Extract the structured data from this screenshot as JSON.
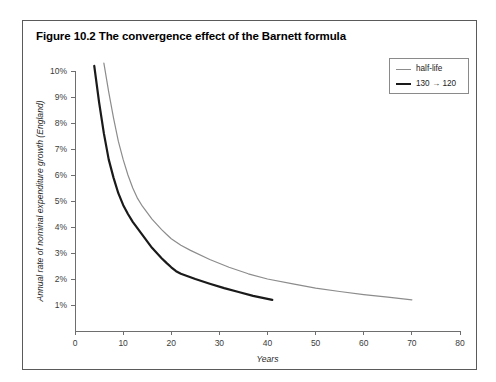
{
  "figure": {
    "title": "Figure 10.2 The convergence effect of the Barnett formula"
  },
  "legend": {
    "entries": [
      {
        "label": "half-life",
        "color": "#8c8c8c",
        "width": 1.2
      },
      {
        "label": "130 → 120",
        "color": "#1a1a1a",
        "width": 2.2
      }
    ]
  },
  "chart_data": {
    "type": "line",
    "title": "Figure 10.2 The convergence effect of the Barnett formula",
    "xlabel": "Years",
    "ylabel": "Annual rate of nominal expenditure growth (England)",
    "xlim": [
      0,
      80
    ],
    "ylim": [
      0,
      10.4
    ],
    "xticks": [
      0,
      10,
      20,
      30,
      40,
      50,
      60,
      70,
      80
    ],
    "xtick_labels": [
      "0",
      "10",
      "20",
      "30",
      "40",
      "50",
      "60",
      "70",
      "80"
    ],
    "yticks": [
      1,
      2,
      3,
      4,
      5,
      6,
      7,
      8,
      9,
      10
    ],
    "ytick_labels": [
      "1%",
      "2%",
      "3%",
      "4%",
      "5%",
      "6%",
      "7%",
      "8%",
      "9%",
      "10%"
    ],
    "grid": false,
    "legend_position": "top-right",
    "series": [
      {
        "name": "half-life",
        "color": "#8c8c8c",
        "stroke_width": 1.2,
        "points": [
          [
            6.0,
            10.3
          ],
          [
            7.0,
            9.2
          ],
          [
            8.0,
            8.2
          ],
          [
            9.0,
            7.3
          ],
          [
            10.0,
            6.6
          ],
          [
            11.0,
            6.0
          ],
          [
            12.0,
            5.5
          ],
          [
            13.0,
            5.1
          ],
          [
            14.0,
            4.8
          ],
          [
            15.0,
            4.55
          ],
          [
            16.0,
            4.3
          ],
          [
            17.0,
            4.1
          ],
          [
            18.0,
            3.9
          ],
          [
            19.0,
            3.72
          ],
          [
            20.0,
            3.55
          ],
          [
            22.0,
            3.3
          ],
          [
            24.0,
            3.1
          ],
          [
            28.0,
            2.75
          ],
          [
            32.0,
            2.45
          ],
          [
            36.0,
            2.2
          ],
          [
            40.0,
            2.0
          ],
          [
            45.0,
            1.82
          ],
          [
            50.0,
            1.65
          ],
          [
            55.0,
            1.52
          ],
          [
            60.0,
            1.4
          ],
          [
            65.0,
            1.3
          ],
          [
            70.0,
            1.2
          ]
        ]
      },
      {
        "name": "130 → 120",
        "color": "#1a1a1a",
        "stroke_width": 2.2,
        "points": [
          [
            4.0,
            10.2
          ],
          [
            5.0,
            8.8
          ],
          [
            6.0,
            7.6
          ],
          [
            7.0,
            6.6
          ],
          [
            8.0,
            5.9
          ],
          [
            9.0,
            5.3
          ],
          [
            10.0,
            4.85
          ],
          [
            11.0,
            4.5
          ],
          [
            12.0,
            4.2
          ],
          [
            13.0,
            3.95
          ],
          [
            14.0,
            3.7
          ],
          [
            15.0,
            3.45
          ],
          [
            16.0,
            3.2
          ],
          [
            17.0,
            3.0
          ],
          [
            18.0,
            2.8
          ],
          [
            19.0,
            2.62
          ],
          [
            20.0,
            2.45
          ],
          [
            21.0,
            2.3
          ],
          [
            22.0,
            2.2
          ],
          [
            25.0,
            2.0
          ],
          [
            28.0,
            1.82
          ],
          [
            31.0,
            1.65
          ],
          [
            34.0,
            1.5
          ],
          [
            37.0,
            1.35
          ],
          [
            41.0,
            1.2
          ]
        ]
      }
    ]
  }
}
